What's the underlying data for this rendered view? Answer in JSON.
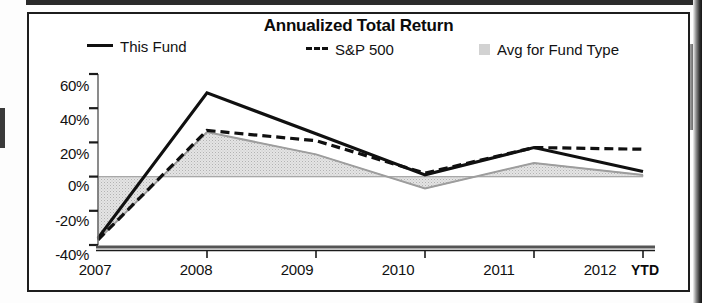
{
  "chart": {
    "title": "Annualized Total Return",
    "legend": [
      {
        "label": "This Fund",
        "marker": "solid-line-swatch",
        "color": "#101010"
      },
      {
        "label": "S&P 500",
        "marker": "dashed-line-swatch",
        "color": "#101010"
      },
      {
        "label": "Avg for Fund Type",
        "marker": "area-swatch",
        "color": "#d2d2d2"
      }
    ],
    "x_axis_note": "YTD"
  },
  "chart_data": {
    "type": "line",
    "title": "Annualized Total Return",
    "xlabel": "",
    "ylabel": "",
    "categories": [
      "2007",
      "2008",
      "2009",
      "2010",
      "2011",
      "2012"
    ],
    "x_tick_labels": [
      "2007",
      "2008",
      "2009",
      "2010",
      "2011",
      "2012"
    ],
    "x_axis_suffix": "YTD",
    "y_tick_labels": [
      "60%",
      "40%",
      "20%",
      "0%",
      "-20%",
      "-40%"
    ],
    "y_ticks": [
      60,
      40,
      20,
      0,
      -20,
      -40
    ],
    "ylim": [
      -40,
      60
    ],
    "grid": false,
    "legend_position": "top",
    "series": [
      {
        "name": "This Fund",
        "style": "solid",
        "color": "#101010",
        "values": [
          -36,
          49,
          25,
          1,
          17,
          3
        ]
      },
      {
        "name": "S&P 500",
        "style": "dashed",
        "color": "#101010",
        "values": [
          -37,
          27,
          21,
          2,
          17,
          16
        ]
      },
      {
        "name": "Avg for Fund Type",
        "style": "filled-area",
        "color": "#d2d2d2",
        "values": [
          -37,
          26,
          13,
          -7,
          8,
          1
        ]
      }
    ]
  },
  "y_labels": [
    {
      "text": "60%",
      "top": 63
    },
    {
      "text": "40%",
      "top": 97
    },
    {
      "text": "20%",
      "top": 131
    },
    {
      "text": "0%",
      "top": 163
    },
    {
      "text": "-20%",
      "top": 198
    },
    {
      "text": "-40%",
      "top": 232
    }
  ],
  "x_labels": [
    {
      "text": "2007",
      "left": 38
    },
    {
      "text": "2008",
      "left": 139
    },
    {
      "text": "2009",
      "left": 240
    },
    {
      "text": "2010",
      "left": 341
    },
    {
      "text": "2011",
      "left": 442
    },
    {
      "text": "2012",
      "left": 543
    }
  ],
  "x_axis_suffix": {
    "text": "YTD",
    "left": 602
  }
}
